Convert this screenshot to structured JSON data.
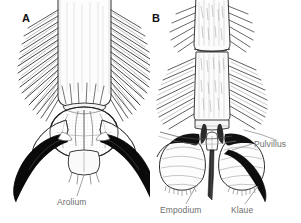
{
  "figure": {
    "type": "scientific-line-illustration",
    "background_color": "#ffffff",
    "ink_color": "#1a1a1a",
    "label_color": "#6e6e6e",
    "width": 301,
    "height": 223
  },
  "panels": [
    {
      "id": "A",
      "letter": "A",
      "description": "Pretarsus with large central arolium flanked by two stout dark claws; tarsus bearing dense rows of lateral setae",
      "labels": [
        {
          "key": "arolium",
          "text": "Arolium",
          "target": "central adhesive pad"
        }
      ]
    },
    {
      "id": "B",
      "letter": "B",
      "description": "Pretarsus with two broad striated pulvilli, slender median empodium and paired dark claws; hairy tarsal segments",
      "labels": [
        {
          "key": "empodium",
          "text": "Empodium",
          "target": "median bristle-like process"
        },
        {
          "key": "klaue",
          "text": "Klaue",
          "target": "claw"
        },
        {
          "key": "pulvillus",
          "text": "Pulvillus",
          "target": "lateral adhesive pad"
        }
      ]
    }
  ],
  "labels": {
    "panel_a_letter": "A",
    "panel_b_letter": "B",
    "arolium": "Arolium",
    "empodium": "Empodium",
    "klaue": "Klaue",
    "pulvillus": "Pulvillus"
  }
}
